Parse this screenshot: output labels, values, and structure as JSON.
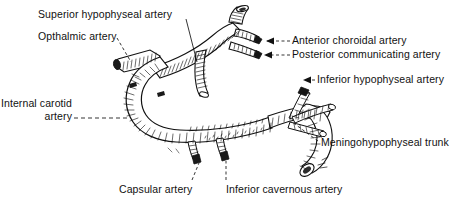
{
  "figure": {
    "style": "pen-and-ink anatomical line drawing",
    "ink_color": "#111111",
    "background_color": "#ffffff",
    "width": 462,
    "height": 209
  },
  "labels": {
    "superior_hypophyseal": "Superior hypophyseal artery",
    "ophthalmic": "Opthalmic artery",
    "anterior_choroidal": "Anterior choroidal artery",
    "posterior_communicating": "Posterior communicating artery",
    "inferior_hypophyseal": "Inferior hypophyseal artery",
    "internal_carotid_line1": "Internal carotid",
    "internal_carotid_line2": "artery",
    "meningohypophyseal": "Meningohypophyseal trunk",
    "capsular": "Capsular artery",
    "inferior_cavernous": "Inferior cavernous artery"
  }
}
